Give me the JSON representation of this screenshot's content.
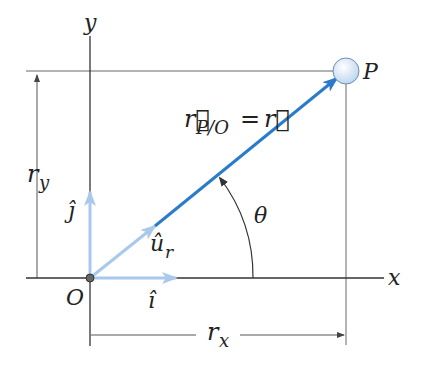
{
  "diagram": {
    "type": "position-vector-diagram",
    "labels": {
      "y_axis": "y",
      "x_axis": "x",
      "origin": "O",
      "point": "P",
      "r_y": "r",
      "r_y_sub": "y",
      "r_x": "r",
      "r_x_sub": "x",
      "j_hat": "ĵ",
      "i_hat": "î",
      "u_r": "û",
      "u_r_sub": "r",
      "theta": "θ",
      "vec_r_main": "r⃗",
      "vec_r_sub": "P/O",
      "equals": "=",
      "vec_r_rhs": "r⃗"
    },
    "colors": {
      "axis": "#333333",
      "thin_line": "#555555",
      "position_vector": "#2a7bc9",
      "unit_vector": "#a8c8ec",
      "point_fill": "#d6e6f5",
      "origin_dot": "#666666"
    }
  }
}
